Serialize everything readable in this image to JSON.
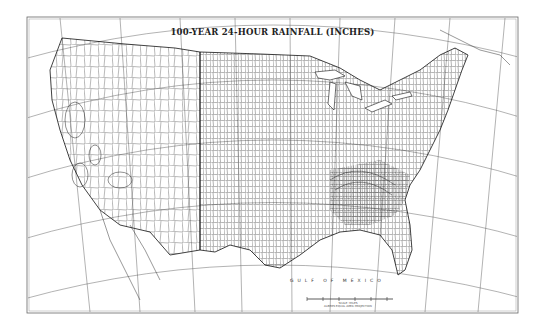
{
  "map": {
    "title": "100-YEAR 24-HOUR RAINFALL (INCHES)",
    "water_label": "GULF OF MEXICO",
    "scale_bar": {
      "caption_line1": "SCALE: MILES",
      "caption_line2": "ALBERS EQUAL AREA PROJECTION"
    },
    "region": "Conterminous United States",
    "features": [
      "state boundaries",
      "county boundaries",
      "graticule",
      "isohyet contours"
    ],
    "colors": {
      "background": "#ffffff",
      "linework": "#1a1a1a",
      "frame": "#555555"
    }
  }
}
